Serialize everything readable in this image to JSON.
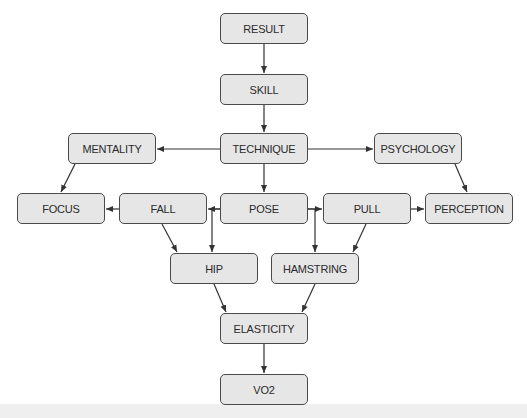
{
  "diagram": {
    "type": "flowchart",
    "colors": {
      "node_fill": "#e6e6e6",
      "node_border": "#4a4a4a",
      "edge": "#333333",
      "text": "#2b2b2b"
    },
    "nodes": {
      "result": {
        "label": "RESULT",
        "x": 220,
        "y": 13
      },
      "skill": {
        "label": "SKILL",
        "x": 220,
        "y": 74
      },
      "technique": {
        "label": "TECHNIQUE",
        "x": 220,
        "y": 133
      },
      "mentality": {
        "label": "MENTALITY",
        "x": 68,
        "y": 133
      },
      "psychology": {
        "label": "PSYCHOLOGY",
        "x": 374,
        "y": 133
      },
      "focus": {
        "label": "FOCUS",
        "x": 17,
        "y": 193
      },
      "fall": {
        "label": "FALL",
        "x": 119,
        "y": 193
      },
      "pose": {
        "label": "POSE",
        "x": 220,
        "y": 193
      },
      "pull": {
        "label": "PULL",
        "x": 323,
        "y": 193
      },
      "perception": {
        "label": "PERCEPTION",
        "x": 425,
        "y": 193
      },
      "hip": {
        "label": "HIP",
        "x": 170,
        "y": 253
      },
      "hamstring": {
        "label": "HAMSTRING",
        "x": 271,
        "y": 253
      },
      "elasticity": {
        "label": "ELASTICITY",
        "x": 220,
        "y": 313
      },
      "vo2": {
        "label": "VO2",
        "x": 220,
        "y": 374
      }
    },
    "edges": [
      [
        "RESULT",
        "SKILL"
      ],
      [
        "SKILL",
        "TECHNIQUE"
      ],
      [
        "TECHNIQUE",
        "MENTALITY"
      ],
      [
        "TECHNIQUE",
        "PSYCHOLOGY"
      ],
      [
        "TECHNIQUE",
        "POSE"
      ],
      [
        "MENTALITY",
        "FOCUS"
      ],
      [
        "PSYCHOLOGY",
        "PERCEPTION"
      ],
      [
        "FALL",
        "FOCUS"
      ],
      [
        "POSE",
        "FALL"
      ],
      [
        "POSE",
        "HIP"
      ],
      [
        "POSE",
        "PULL"
      ],
      [
        "POSE",
        "HAMSTRING"
      ],
      [
        "PULL",
        "PERCEPTION"
      ],
      [
        "FALL",
        "HIP"
      ],
      [
        "PULL",
        "HAMSTRING"
      ],
      [
        "HIP",
        "ELASTICITY"
      ],
      [
        "HAMSTRING",
        "ELASTICITY"
      ],
      [
        "ELASTICITY",
        "VO2"
      ]
    ]
  }
}
